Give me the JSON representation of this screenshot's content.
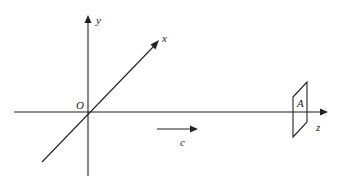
{
  "diagram": {
    "labels": {
      "origin": "O",
      "y_axis": "y",
      "x_axis": "x",
      "z_axis": "z",
      "plane": "A",
      "velocity": "c"
    },
    "colors": {
      "stroke": "#222222",
      "background": "#ffffff"
    }
  }
}
